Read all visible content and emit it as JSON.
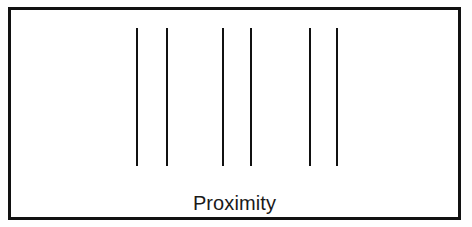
{
  "figure": {
    "caption": "Proximity",
    "background_color": "#fefefe",
    "panel_color": "#ffffff",
    "frame": {
      "stroke_color": "#111111",
      "stroke_width_px": 3,
      "x": 8,
      "y": 7,
      "width": 453,
      "height": 213
    },
    "strokes": {
      "color": "#111111",
      "width_px": 2,
      "top_y": 25,
      "bottom_y": 163,
      "count": 6,
      "group_count": 3,
      "x_positions": [
        133,
        163,
        219,
        247,
        306,
        333
      ]
    },
    "groups": [
      {
        "name": "group-1",
        "offset_x": 125,
        "lines": [
          {
            "name": "line-1",
            "x": 0
          },
          {
            "name": "line-2",
            "x": 30
          }
        ]
      },
      {
        "name": "group-2",
        "offset_x": 211,
        "lines": [
          {
            "name": "line-3",
            "x": 0
          },
          {
            "name": "line-4",
            "x": 28
          }
        ]
      },
      {
        "name": "group-3",
        "offset_x": 298,
        "lines": [
          {
            "name": "line-5",
            "x": 0
          },
          {
            "name": "line-6",
            "x": 27
          }
        ]
      }
    ]
  }
}
